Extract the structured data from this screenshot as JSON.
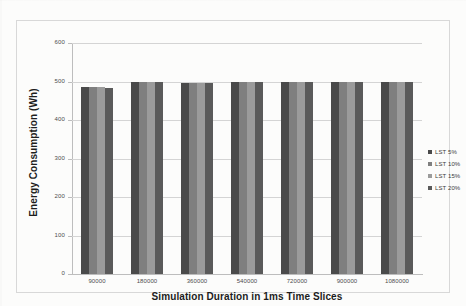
{
  "chart_data": {
    "type": "bar",
    "title": "",
    "xlabel": "Simulation Duration in 1ms Time Slices",
    "ylabel": "Energy Consumption (Wh)",
    "ylim": [
      0,
      600
    ],
    "yticks": [
      0,
      100,
      200,
      300,
      400,
      500,
      600
    ],
    "ytick_labels": [
      "0",
      "100",
      "200",
      "300",
      "400",
      "500",
      "600"
    ],
    "grid": true,
    "legend_position": "right",
    "categories": [
      "90000",
      "180000",
      "360000",
      "540000",
      "720000",
      "900000",
      "1080000"
    ],
    "series": [
      {
        "name": "LST 5%",
        "color": "#4a4a4a",
        "values": [
          485,
          500,
          496,
          499,
          500,
          500,
          500
        ]
      },
      {
        "name": "LST 10%",
        "color": "#7f7f7f",
        "values": [
          486,
          500,
          496,
          498,
          500,
          500,
          500
        ]
      },
      {
        "name": "LST 15%",
        "color": "#9b9b9b",
        "values": [
          486,
          500,
          496,
          498,
          500,
          500,
          500
        ]
      },
      {
        "name": "LST 20%",
        "color": "#5a5a5a",
        "values": [
          484,
          500,
          496,
          498,
          500,
          500,
          500
        ]
      }
    ]
  },
  "legend": {
    "items": [
      {
        "label": "LST 5%",
        "color": "#4a4a4a"
      },
      {
        "label": "LST 10%",
        "color": "#7f7f7f"
      },
      {
        "label": "LST 15%",
        "color": "#9b9b9b"
      },
      {
        "label": "LST 20%",
        "color": "#5a5a5a"
      }
    ]
  }
}
